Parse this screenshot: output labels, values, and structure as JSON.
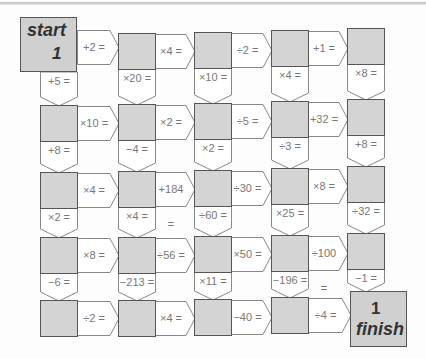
{
  "puzzle": {
    "start_label": "start",
    "start_value": "1",
    "finish_value": "1",
    "finish_label": "finish",
    "rows": [
      {
        "right_ops": [
          "+2 =",
          "×4 =",
          "÷2 =",
          "+1 ="
        ],
        "down_ops": [
          "+5 =",
          "×20 =",
          "×10 =",
          "×4 =",
          "×8 ="
        ]
      },
      {
        "right_ops": [
          "×10 =",
          "×2 =",
          "÷5 =",
          "+32 ="
        ],
        "down_ops": [
          "+8 =",
          "−4 =",
          "×2 =",
          "÷3 =",
          "+8 ="
        ]
      },
      {
        "right_ops": [
          "×4 =",
          "+184 =",
          "÷30 =",
          "×8 ="
        ],
        "down_ops": [
          "×2 =",
          "×4 =",
          "÷60 =",
          "×25 =",
          "÷32 ="
        ]
      },
      {
        "right_ops": [
          "×8 =",
          "÷56 =",
          "×50 =",
          "÷100 ="
        ],
        "down_ops": [
          "−6 =",
          "−213 =",
          "×11 =",
          "−196 =",
          "−1 ="
        ]
      },
      {
        "right_ops": [
          "÷2 =",
          "×4 =",
          "−40 =",
          "÷4 ="
        ],
        "down_ops": []
      }
    ]
  },
  "colors": {
    "box_fill": "#d4d4d4",
    "box_border": "#555555",
    "op_text": "#777777"
  }
}
